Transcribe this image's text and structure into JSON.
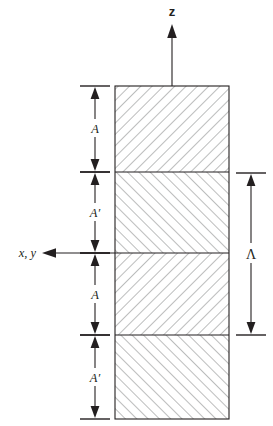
{
  "figure": {
    "background_color": "#ffffff",
    "line_color": "#231f20",
    "hatch_color": "#58595b"
  },
  "axes": {
    "vertical": {
      "label": "z",
      "name": "z-axis",
      "direction": "up",
      "style": "bold upright"
    },
    "horizontal": {
      "label": "x, y",
      "name": "xy-axis",
      "direction": "left",
      "style": "italic"
    }
  },
  "structure": {
    "name": "layer-stack",
    "layer_count": 4,
    "layers": [
      {
        "id": "layer-1",
        "label": "A",
        "order": 1,
        "hatch": "forward",
        "boundary_top": 86,
        "boundary_bottom": 172
      },
      {
        "id": "layer-2",
        "label": "A'",
        "order": 2,
        "hatch": "backward",
        "boundary_top": 172,
        "boundary_bottom": 253
      },
      {
        "id": "layer-3",
        "label": "A",
        "order": 3,
        "hatch": "forward",
        "boundary_top": 253,
        "boundary_bottom": 335
      },
      {
        "id": "layer-4",
        "label": "A'",
        "order": 4,
        "hatch": "backward",
        "boundary_top": 335,
        "boundary_bottom": 419
      }
    ]
  },
  "dimensions": {
    "left": [
      {
        "id": "dim-a-1",
        "label": "A",
        "prime": false,
        "from": 86,
        "to": 172
      },
      {
        "id": "dim-aprime-1",
        "label": "A",
        "prime": true,
        "from": 172,
        "to": 253
      },
      {
        "id": "dim-a-2",
        "label": "A",
        "prime": false,
        "from": 253,
        "to": 335
      },
      {
        "id": "dim-aprime-2",
        "label": "A",
        "prime": true,
        "from": 335,
        "to": 419
      }
    ],
    "right": [
      {
        "id": "dim-period",
        "label": "Λ",
        "name": "period-lambda",
        "from": 173,
        "to": 335
      }
    ]
  },
  "labels": {
    "a": "A",
    "a_prime_base": "A",
    "prime_mark": "′",
    "lambda": "Λ",
    "z": "z",
    "xy": "x, y"
  }
}
